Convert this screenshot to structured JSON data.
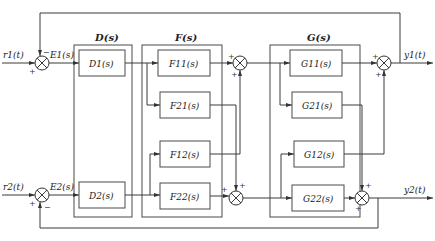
{
  "diagram": {
    "groups": [
      {
        "id": "D",
        "label": "D(s)",
        "blocks": [
          "D1(s)",
          "D2(s)"
        ]
      },
      {
        "id": "F",
        "label": "F(s)",
        "blocks": [
          "F11(s)",
          "F21(s)",
          "F12(s)",
          "F22(s)"
        ]
      },
      {
        "id": "G",
        "label": "G(s)",
        "blocks": [
          "G11(s)",
          "G21(s)",
          "G12(s)",
          "G22(s)"
        ]
      }
    ],
    "inputs": {
      "r1": "r1(t)",
      "r2": "r2(t)"
    },
    "errors": {
      "e1": "E1(s)",
      "e2": "E2(s)"
    },
    "outputs": {
      "y1": "y1(t)",
      "y2": "y2(t)"
    },
    "signs": {
      "plus": "+",
      "minus": "−"
    },
    "colors": {
      "line": "#3a3a3a",
      "background": "#ffffff"
    }
  }
}
